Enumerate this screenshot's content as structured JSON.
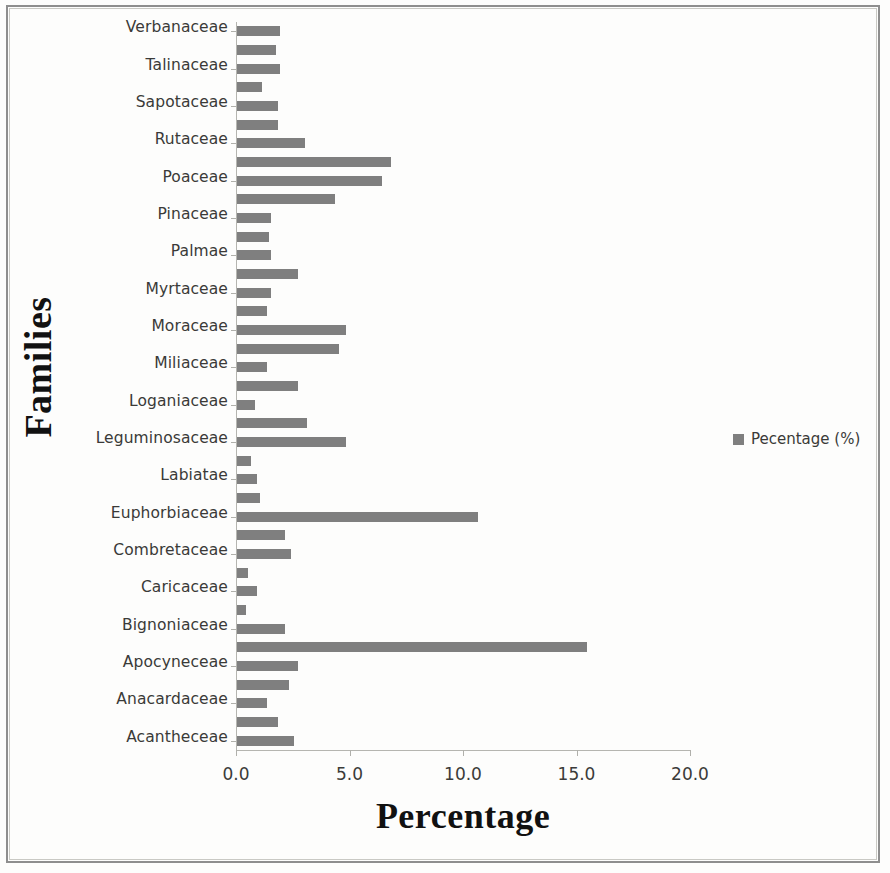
{
  "chart_data": {
    "type": "bar",
    "orientation": "horizontal",
    "title": "",
    "xlabel": "Percentage",
    "ylabel": "Families",
    "xlim": [
      0.0,
      20.0
    ],
    "xticks": [
      "0.0",
      "5.0",
      "10.0",
      "15.0",
      "20.0"
    ],
    "xtick_values": [
      0.0,
      5.0,
      10.0,
      15.0,
      20.0
    ],
    "grid": false,
    "legend": {
      "position": "right",
      "entries": [
        "Pecentage (%)"
      ]
    },
    "bar_color": "#7f7f7f",
    "note": "Category labels appear on alternating tick slots; two bars are drawn per labelled family slot (44 bars, 22 labels).",
    "categories": [
      "Verbanaceae",
      "Talinaceae",
      "Sapotaceae",
      "Rutaceae",
      "Poaceae",
      "Pinaceae",
      "Palmae",
      "Myrtaceae",
      "Moraceae",
      "Miliaceae",
      "Loganiaceae",
      "Leguminosaceae",
      "Labiatae",
      "Euphorbiaceae",
      "Combretaceae",
      "Caricaceae",
      "Bignoniaceae",
      "Apocyneceae",
      "Anacardaceae",
      "Acantheceae"
    ],
    "values": [
      1.9,
      1.9,
      1.8,
      3.0,
      6.4,
      1.5,
      1.5,
      2.7,
      4.8,
      1.3,
      2.7,
      4.8,
      0.9,
      10.6,
      2.4,
      0.9,
      2.1,
      2.7,
      1.3,
      2.5
    ],
    "bars": [
      1.9,
      1.7,
      1.9,
      1.1,
      1.8,
      1.8,
      3.0,
      6.8,
      6.4,
      4.3,
      1.5,
      1.4,
      1.5,
      2.7,
      1.5,
      1.3,
      4.8,
      4.5,
      1.3,
      2.7,
      0.8,
      3.1,
      4.8,
      0.6,
      0.9,
      1.0,
      10.6,
      2.1,
      2.4,
      0.5,
      0.9,
      0.4,
      2.1,
      15.4,
      2.7,
      2.3,
      1.3,
      1.8,
      2.5
    ]
  },
  "axis": {
    "y_title": "Families",
    "x_title": "Percentage"
  },
  "legend": {
    "label": "Pecentage (%)",
    "swatch_color": "#7f7f7f"
  }
}
